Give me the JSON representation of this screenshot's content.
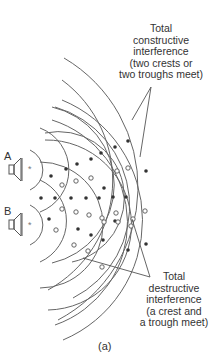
{
  "diagram": {
    "sources": [
      {
        "label": "A"
      },
      {
        "label": "B"
      }
    ],
    "annotations": {
      "constructive": {
        "lines": [
          "Total",
          "constructive",
          "interference",
          "(two crests or",
          "two troughs meet)"
        ]
      },
      "destructive": {
        "lines": [
          "Total",
          "destructive",
          "interference",
          "(a crest and",
          "a trough meet)"
        ]
      }
    },
    "caption": "(a)",
    "legend": {
      "constructive_marker": "filled dot",
      "destructive_marker": "open circle"
    },
    "colors": {
      "line": "#555555",
      "dot": "#333333",
      "text": "#333333"
    }
  }
}
